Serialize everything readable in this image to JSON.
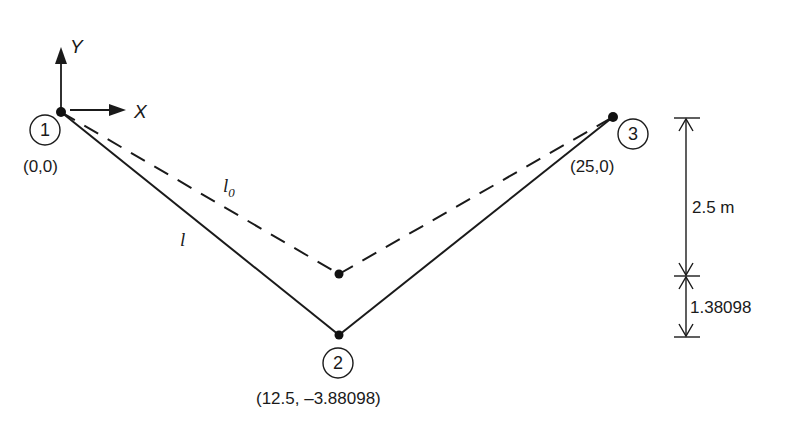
{
  "diagram": {
    "axes": {
      "x_label": "X",
      "y_label": "Y"
    },
    "nodes": [
      {
        "id": "1",
        "coord_label": "(0,0)"
      },
      {
        "id": "2",
        "coord_label": "(12.5, –3.88098)"
      },
      {
        "id": "3",
        "coord_label": "(25,0)"
      }
    ],
    "members": {
      "deformed_label": "l",
      "original_label": "l",
      "original_subscript": "0"
    },
    "dimensions": {
      "upper": "2.5 m",
      "lower": "1.38098"
    }
  }
}
